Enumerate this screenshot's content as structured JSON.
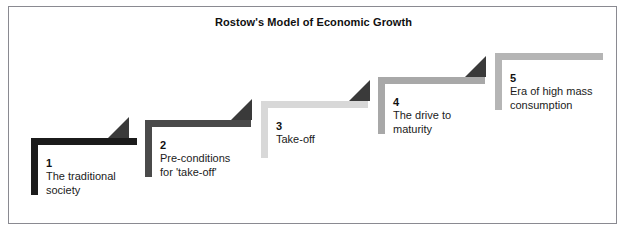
{
  "figure": {
    "title": "Rostow's Model of Economic Growth",
    "type": "staircase-diagram",
    "border_color": "#8a8a91",
    "background": "#ffffff"
  },
  "steps": [
    {
      "number": "1",
      "label": "The traditional\nsociety",
      "color": "#1b1b1b",
      "arrow_color": "#3a3a3a",
      "has_arrow": true,
      "geom": {
        "left": 31,
        "top": 138,
        "width": 106,
        "height": 57,
        "label_x": 15,
        "label_y": 18
      },
      "arrow_geom": {
        "left": 108,
        "top": 117,
        "size": 21
      }
    },
    {
      "number": "2",
      "label": "Pre-conditions\nfor 'take-off'",
      "color": "#4a4a4a",
      "arrow_color": "#3a3a3a",
      "has_arrow": true,
      "geom": {
        "left": 145,
        "top": 120,
        "width": 106,
        "height": 57,
        "label_x": 15,
        "label_y": 18
      },
      "arrow_geom": {
        "left": 231,
        "top": 99,
        "size": 21
      }
    },
    {
      "number": "3",
      "label": "Take-off",
      "color": "#d8d8d8",
      "arrow_color": "#3a3a3a",
      "has_arrow": true,
      "geom": {
        "left": 261,
        "top": 101,
        "width": 107,
        "height": 57,
        "label_x": 15,
        "label_y": 18
      },
      "arrow_geom": {
        "left": 349,
        "top": 80,
        "size": 21
      }
    },
    {
      "number": "4",
      "label": "The drive to\nmaturity",
      "color": "#a8a8a8",
      "arrow_color": "#3a3a3a",
      "has_arrow": true,
      "geom": {
        "left": 378,
        "top": 77,
        "width": 107,
        "height": 57,
        "label_x": 15,
        "label_y": 18
      },
      "arrow_geom": {
        "left": 465,
        "top": 56,
        "size": 21
      }
    },
    {
      "number": "5",
      "label": "Era of high mass\nconsumption",
      "color": "#b5b5b5",
      "arrow_color": "#3a3a3a",
      "has_arrow": false,
      "geom": {
        "left": 495,
        "top": 53,
        "width": 108,
        "height": 57,
        "label_x": 15,
        "label_y": 18
      },
      "arrow_geom": {
        "left": 0,
        "top": 0,
        "size": 0
      }
    }
  ]
}
